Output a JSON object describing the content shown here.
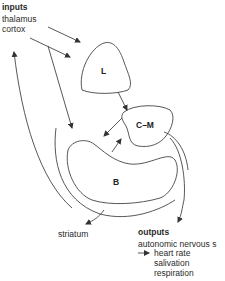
{
  "inputs": {
    "heading": "inputs",
    "items": [
      "thalamus",
      "cortox"
    ]
  },
  "nodes": {
    "L": "L",
    "CM": "C–M",
    "B": "B"
  },
  "striatum": "striatum",
  "outputs": {
    "heading": "outputs",
    "line1": "autonomic nervous s",
    "items": [
      "heart rate",
      "salivation",
      "respiration"
    ]
  },
  "colors": {
    "stroke": "#444444",
    "text": "#2a2a2a"
  }
}
